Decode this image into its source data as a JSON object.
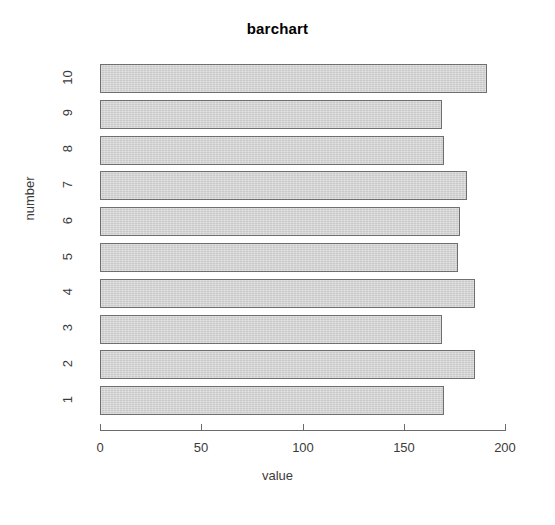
{
  "chart_data": {
    "type": "bar",
    "orientation": "horizontal",
    "title": "barchart",
    "xlabel": "value",
    "ylabel": "number",
    "categories": [
      "1",
      "2",
      "3",
      "4",
      "5",
      "6",
      "7",
      "8",
      "9",
      "10"
    ],
    "values": [
      170,
      185,
      169,
      185,
      177,
      178,
      181,
      170,
      169,
      191
    ],
    "xlim": [
      0,
      200
    ],
    "xticks": [
      0,
      50,
      100,
      150,
      200
    ],
    "xtick_labels": [
      "0",
      "50",
      "100",
      "150",
      "200"
    ],
    "ytick_labels": [
      "10",
      "9",
      "8",
      "7",
      "6",
      "5",
      "4",
      "3",
      "2",
      "1"
    ],
    "grid": false,
    "legend": false,
    "bar_fill_color": "#c9c9c9",
    "bar_border_color": "#6f6f6f",
    "axis_color": "#6b6b6b",
    "text_color": "#3b3b3b",
    "background_color": "#ffffff"
  }
}
